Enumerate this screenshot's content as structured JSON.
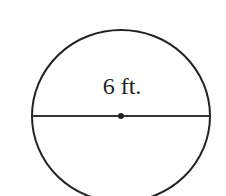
{
  "diagram": {
    "shape": "circle",
    "measurement_label": "6 ft.",
    "measured_segment": "diameter",
    "stroke_color": "#222222",
    "background_color": "#ffffff"
  }
}
